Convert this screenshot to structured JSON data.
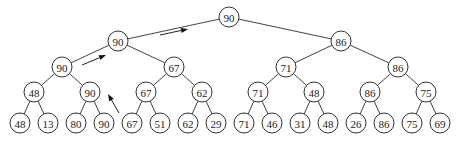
{
  "diagram": {
    "type": "tournament-tree",
    "node_radius": 10,
    "colors": {
      "node_stroke": "#333333",
      "node_fill": "#ffffff",
      "edge": "#444444",
      "text": "#222222",
      "arrow": "#111111"
    },
    "levels": [
      {
        "level": 0,
        "y": 17,
        "nodes": [
          {
            "id": "n0",
            "label": "90",
            "x": 229
          }
        ]
      },
      {
        "level": 1,
        "y": 41,
        "nodes": [
          {
            "id": "n1",
            "label": "90",
            "x": 118
          },
          {
            "id": "n2",
            "label": "86",
            "x": 341
          }
        ]
      },
      {
        "level": 2,
        "y": 67,
        "nodes": [
          {
            "id": "n3",
            "label": "90",
            "x": 62
          },
          {
            "id": "n4",
            "label": "67",
            "x": 174
          },
          {
            "id": "n5",
            "label": "71",
            "x": 286
          },
          {
            "id": "n6",
            "label": "86",
            "x": 398
          }
        ]
      },
      {
        "level": 3,
        "y": 92,
        "nodes": [
          {
            "id": "n7",
            "label": "48",
            "x": 34
          },
          {
            "id": "n8",
            "label": "90",
            "x": 90
          },
          {
            "id": "n9",
            "label": "67",
            "x": 146
          },
          {
            "id": "n10",
            "label": "62",
            "x": 202
          },
          {
            "id": "n11",
            "label": "71",
            "x": 258
          },
          {
            "id": "n12",
            "label": "48",
            "x": 314
          },
          {
            "id": "n13",
            "label": "86",
            "x": 370
          },
          {
            "id": "n14",
            "label": "75",
            "x": 426
          }
        ]
      },
      {
        "level": 4,
        "y": 123,
        "nodes": [
          {
            "id": "n15",
            "label": "48",
            "x": 20
          },
          {
            "id": "n16",
            "label": "13",
            "x": 48
          },
          {
            "id": "n17",
            "label": "80",
            "x": 76
          },
          {
            "id": "n18",
            "label": "90",
            "x": 104
          },
          {
            "id": "n19",
            "label": "67",
            "x": 132
          },
          {
            "id": "n20",
            "label": "51",
            "x": 160
          },
          {
            "id": "n21",
            "label": "62",
            "x": 188
          },
          {
            "id": "n22",
            "label": "29",
            "x": 216
          },
          {
            "id": "n23",
            "label": "71",
            "x": 244
          },
          {
            "id": "n24",
            "label": "46",
            "x": 272
          },
          {
            "id": "n25",
            "label": "31",
            "x": 300
          },
          {
            "id": "n26",
            "label": "48",
            "x": 328
          },
          {
            "id": "n27",
            "label": "26",
            "x": 356
          },
          {
            "id": "n28",
            "label": "86",
            "x": 384
          },
          {
            "id": "n29",
            "label": "75",
            "x": 412
          },
          {
            "id": "n30",
            "label": "69",
            "x": 440
          }
        ]
      }
    ],
    "edges": [
      [
        "n0",
        "n1"
      ],
      [
        "n0",
        "n2"
      ],
      [
        "n1",
        "n3"
      ],
      [
        "n1",
        "n4"
      ],
      [
        "n2",
        "n5"
      ],
      [
        "n2",
        "n6"
      ],
      [
        "n3",
        "n7"
      ],
      [
        "n3",
        "n8"
      ],
      [
        "n4",
        "n9"
      ],
      [
        "n4",
        "n10"
      ],
      [
        "n5",
        "n11"
      ],
      [
        "n5",
        "n12"
      ],
      [
        "n6",
        "n13"
      ],
      [
        "n6",
        "n14"
      ],
      [
        "n7",
        "n15"
      ],
      [
        "n7",
        "n16"
      ],
      [
        "n8",
        "n17"
      ],
      [
        "n8",
        "n18"
      ],
      [
        "n9",
        "n19"
      ],
      [
        "n9",
        "n20"
      ],
      [
        "n10",
        "n21"
      ],
      [
        "n10",
        "n22"
      ],
      [
        "n11",
        "n23"
      ],
      [
        "n11",
        "n24"
      ],
      [
        "n12",
        "n25"
      ],
      [
        "n12",
        "n26"
      ],
      [
        "n13",
        "n27"
      ],
      [
        "n13",
        "n28"
      ],
      [
        "n14",
        "n29"
      ],
      [
        "n14",
        "n30"
      ]
    ],
    "arrows": [
      {
        "name": "promotion-arrow-leaf-to-level3",
        "from": [
          119,
          113
        ],
        "to": [
          108,
          94
        ]
      },
      {
        "name": "promotion-arrow-level2-to-level1",
        "from": [
          82,
          65
        ],
        "to": [
          106,
          55
        ]
      },
      {
        "name": "promotion-arrow-level1-to-root",
        "from": [
          160,
          35
        ],
        "to": [
          188,
          29
        ]
      }
    ]
  }
}
